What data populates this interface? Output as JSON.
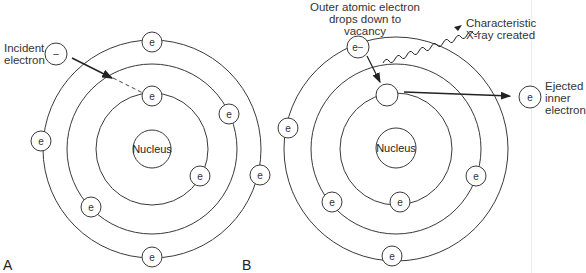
{
  "panels": {
    "a": {
      "label": "A",
      "nucleus": "Nucleus",
      "electron_symbol": "e",
      "incident_symbol": "–",
      "incident_label_line1": "Incident",
      "incident_label_line2": "electron"
    },
    "b": {
      "label": "B",
      "nucleus": "Nucleus",
      "electron_symbol": "e",
      "outer_electron_symbol": "e−",
      "outer_label_line1": "Outer atomic electron",
      "outer_label_line2": "drops down to",
      "outer_label_line3": "vacancy",
      "xray_label_line1": "Characteristic",
      "xray_label_line2": "X-ray created",
      "ejected_label_line1": "Ejected",
      "ejected_label_line2": "inner",
      "ejected_label_line3": "electron"
    }
  },
  "colors": {
    "line": "#3a3a3a",
    "text": "#333333",
    "background": "#ffffff"
  }
}
